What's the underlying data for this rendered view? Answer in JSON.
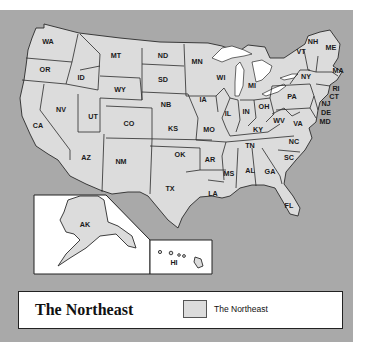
{
  "map": {
    "title": "The Northeast",
    "colors": {
      "ocean": "#a9a9a9",
      "land": "#dcdcdc",
      "water_inland": "#ffffff",
      "border": "#2a2a2a"
    },
    "states": [
      {
        "abbr": "WA",
        "x": 48,
        "y": 42
      },
      {
        "abbr": "OR",
        "x": 45,
        "y": 70
      },
      {
        "abbr": "CA",
        "x": 38,
        "y": 126
      },
      {
        "abbr": "NV",
        "x": 61,
        "y": 110
      },
      {
        "abbr": "ID",
        "x": 81,
        "y": 78
      },
      {
        "abbr": "MT",
        "x": 116,
        "y": 56
      },
      {
        "abbr": "WY",
        "x": 120,
        "y": 90
      },
      {
        "abbr": "UT",
        "x": 93,
        "y": 117
      },
      {
        "abbr": "CO",
        "x": 129,
        "y": 124
      },
      {
        "abbr": "AZ",
        "x": 86,
        "y": 158
      },
      {
        "abbr": "NM",
        "x": 121,
        "y": 162
      },
      {
        "abbr": "ND",
        "x": 163,
        "y": 56
      },
      {
        "abbr": "SD",
        "x": 163,
        "y": 80
      },
      {
        "abbr": "NB",
        "x": 166,
        "y": 105
      },
      {
        "abbr": "KS",
        "x": 173,
        "y": 129
      },
      {
        "abbr": "OK",
        "x": 180,
        "y": 155
      },
      {
        "abbr": "TX",
        "x": 170,
        "y": 189
      },
      {
        "abbr": "MN",
        "x": 197,
        "y": 62
      },
      {
        "abbr": "IA",
        "x": 203,
        "y": 100
      },
      {
        "abbr": "MO",
        "x": 209,
        "y": 130
      },
      {
        "abbr": "AR",
        "x": 210,
        "y": 160
      },
      {
        "abbr": "LA",
        "x": 213,
        "y": 194
      },
      {
        "abbr": "WI",
        "x": 221,
        "y": 78
      },
      {
        "abbr": "IL",
        "x": 228,
        "y": 114
      },
      {
        "abbr": "MI",
        "x": 252,
        "y": 86
      },
      {
        "abbr": "IN",
        "x": 246,
        "y": 112
      },
      {
        "abbr": "OH",
        "x": 264,
        "y": 107
      },
      {
        "abbr": "KY",
        "x": 258,
        "y": 130
      },
      {
        "abbr": "TN",
        "x": 250,
        "y": 146
      },
      {
        "abbr": "MS",
        "x": 229,
        "y": 174
      },
      {
        "abbr": "AL",
        "x": 250,
        "y": 171
      },
      {
        "abbr": "GA",
        "x": 270,
        "y": 172
      },
      {
        "abbr": "FL",
        "x": 289,
        "y": 206
      },
      {
        "abbr": "SC",
        "x": 289,
        "y": 158
      },
      {
        "abbr": "NC",
        "x": 294,
        "y": 142
      },
      {
        "abbr": "VA",
        "x": 298,
        "y": 124
      },
      {
        "abbr": "WV",
        "x": 279,
        "y": 121
      },
      {
        "abbr": "PA",
        "x": 292,
        "y": 97
      },
      {
        "abbr": "NY",
        "x": 306,
        "y": 77
      },
      {
        "abbr": "VT",
        "x": 301,
        "y": 52
      },
      {
        "abbr": "NH",
        "x": 313,
        "y": 42
      },
      {
        "abbr": "ME",
        "x": 331,
        "y": 48
      },
      {
        "abbr": "MA",
        "x": 338,
        "y": 71
      },
      {
        "abbr": "RI",
        "x": 336,
        "y": 89
      },
      {
        "abbr": "CT",
        "x": 334,
        "y": 97
      },
      {
        "abbr": "NJ",
        "x": 326,
        "y": 104
      },
      {
        "abbr": "DE",
        "x": 326,
        "y": 113
      },
      {
        "abbr": "MD",
        "x": 325,
        "y": 122
      },
      {
        "abbr": "AK",
        "x": 85,
        "y": 225
      },
      {
        "abbr": "HI",
        "x": 174,
        "y": 263
      }
    ]
  },
  "legend": {
    "title": "The Northeast",
    "items": [
      {
        "label": "The Northeast",
        "color": "#dcdcdc"
      }
    ]
  }
}
